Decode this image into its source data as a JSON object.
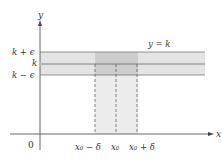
{
  "diagram": {
    "axes": {
      "x_label": "x",
      "y_label": "y",
      "origin_label": "0"
    },
    "y_labels": {
      "upper": "k + ϵ",
      "middle": "k",
      "lower": "k − ϵ"
    },
    "curve_label": "y = k",
    "x_labels": {
      "left": "x₀ − δ",
      "center": "x₀",
      "right": "x₀ + δ"
    },
    "colors": {
      "horizontal_band": "#e6e6e6",
      "overlap": "#cfcfcf",
      "vertical_band": "#ececec",
      "lines": "#666666"
    }
  }
}
